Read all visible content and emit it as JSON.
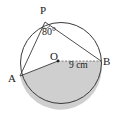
{
  "diagram": {
    "type": "circle-geometry",
    "colors": {
      "stroke": "#3a3a3a",
      "shade": "#cfcfcf",
      "background": "#ffffff"
    },
    "circle": {
      "center_label": "O",
      "radius_label": "9 cm"
    },
    "points": {
      "P": "P",
      "A": "A",
      "B": "B",
      "O": "O"
    },
    "angle": {
      "at": "P",
      "label": "80°"
    },
    "shaded_region": "sector AOB (lower)"
  }
}
